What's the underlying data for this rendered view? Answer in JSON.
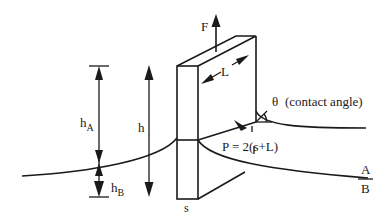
{
  "diagram": {
    "labels": {
      "force": "F",
      "length": "L",
      "angle_symbol": "θ",
      "angle_note": "(contact angle)",
      "perimeter": "P = 2(s+L)",
      "height_total": "h",
      "height_a_main": "h",
      "height_a_sub": "A",
      "height_b_main": "h",
      "height_b_sub": "B",
      "thickness": "s",
      "phase_upper": "A",
      "phase_lower": "B"
    },
    "colors": {
      "stroke": "#1a1a1a",
      "background": "#ffffff"
    }
  }
}
